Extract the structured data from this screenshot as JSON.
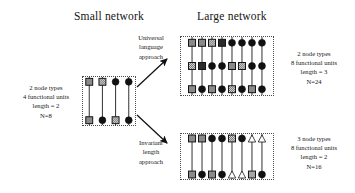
{
  "figure": {
    "column_titles": {
      "small": "Small network",
      "large": "Large network"
    },
    "arrow_labels": {
      "universal": [
        "Universal",
        "language",
        "approach"
      ],
      "invariant": [
        "Invariant",
        "length",
        "approach"
      ]
    },
    "captions": {
      "small": [
        "2 node types",
        "4 functional units",
        "length = 2",
        "N=8"
      ],
      "large_top": [
        "2 node types",
        "8 functional units",
        "length = 3",
        "N=24"
      ],
      "large_bottom": [
        "3 node types",
        "8 functional units",
        "length = 2",
        "N=16"
      ]
    }
  },
  "chart_data": {
    "type": "diagram",
    "node_glyphs": {
      "square_gray": "gray filled square node",
      "square_hatched": "checkered/hatched square node",
      "square_dark": "dark filled square node",
      "circle_black": "black filled circle node",
      "triangle_white": "white outlined triangle node"
    },
    "colors": {
      "square_gray": "#8a8a8a",
      "square_dark": "#2b2b2b",
      "circle_black": "#111111",
      "triangle_fill": "#ffffff",
      "stroke": "#111111",
      "box_border": "#4a4a4a",
      "background": "#ffffff"
    },
    "networks": [
      {
        "name": "small-network",
        "columns": 4,
        "rows": 2,
        "node_types": 2,
        "functional_units": 4,
        "length": 2,
        "N": 8,
        "matrix": [
          [
            "square_gray",
            "square_hatched",
            "circle_black",
            "circle_black"
          ],
          [
            "square_gray",
            "circle_black",
            "square_hatched",
            "circle_black"
          ]
        ]
      },
      {
        "name": "large-network-universal-language",
        "columns": 8,
        "rows": 3,
        "node_types": 2,
        "functional_units": 8,
        "length": 3,
        "N": 24,
        "matrix": [
          [
            "square_gray",
            "square_gray",
            "square_hatched",
            "square_dark",
            "circle_black",
            "circle_black",
            "circle_black",
            "circle_black"
          ],
          [
            "square_hatched",
            "square_dark",
            "circle_black",
            "circle_black",
            "square_gray",
            "square_hatched",
            "circle_black",
            "circle_black"
          ],
          [
            "square_gray",
            "circle_black",
            "square_gray",
            "circle_black",
            "square_hatched",
            "circle_black",
            "square_gray",
            "circle_black"
          ]
        ]
      },
      {
        "name": "large-network-invariant-length",
        "columns": 8,
        "rows": 2,
        "node_types": 3,
        "functional_units": 8,
        "length": 2,
        "N": 16,
        "matrix": [
          [
            "square_gray",
            "square_gray",
            "circle_black",
            "circle_black",
            "square_hatched",
            "circle_black",
            "triangle_white",
            "triangle_white"
          ],
          [
            "square_gray",
            "circle_black",
            "square_gray",
            "circle_black",
            "triangle_white",
            "triangle_white",
            "square_hatched",
            "circle_black"
          ]
        ]
      }
    ],
    "arrows": [
      {
        "name": "arrow-universal",
        "from": "small-network",
        "to": "large-network-universal-language",
        "label": "Universal language approach"
      },
      {
        "name": "arrow-invariant",
        "from": "small-network",
        "to": "large-network-invariant-length",
        "label": "Invariant length approach"
      }
    ]
  }
}
